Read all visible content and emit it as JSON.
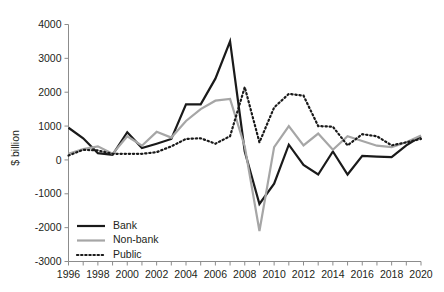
{
  "chart_data": {
    "type": "line",
    "title": "",
    "subtitle": "",
    "xlabel": "",
    "ylabel": "$ billion",
    "xlim": [
      1996,
      2020
    ],
    "ylim": [
      -3000,
      4000
    ],
    "grid": false,
    "legend_position": "bottom-left",
    "x": [
      1996,
      1997,
      1998,
      1999,
      2000,
      2001,
      2002,
      2003,
      2004,
      2005,
      2006,
      2007,
      2008,
      2009,
      2010,
      2011,
      2012,
      2013,
      2014,
      2015,
      2016,
      2017,
      2018,
      2019,
      2020
    ],
    "x_tick_labels": [
      "1996",
      "1998",
      "2000",
      "2002",
      "2004",
      "2006",
      "2008",
      "2010",
      "2012",
      "2014",
      "2016",
      "2018",
      "2020"
    ],
    "y_tick_labels": [
      "4000",
      "3000",
      "2000",
      "1000",
      "0",
      "-1000",
      "-2000",
      "-3000"
    ],
    "y_ticks": [
      4000,
      3000,
      2000,
      1000,
      0,
      -1000,
      -2000,
      -3000
    ],
    "series": [
      {
        "name": "Bank",
        "style": "solid",
        "color": "#1a1a1a",
        "width": 2.2,
        "values": [
          950,
          640,
          200,
          150,
          820,
          350,
          480,
          620,
          1640,
          1640,
          2400,
          3500,
          250,
          -1300,
          -700,
          450,
          -150,
          -430,
          250,
          -430,
          120,
          100,
          80,
          430,
          700
        ]
      },
      {
        "name": "Non-bank",
        "style": "solid",
        "color": "#a6a6a6",
        "width": 2.2,
        "values": [
          180,
          320,
          400,
          180,
          700,
          420,
          830,
          660,
          1150,
          1500,
          1750,
          1800,
          400,
          -2100,
          380,
          1000,
          430,
          780,
          300,
          700,
          560,
          420,
          380,
          520,
          720
        ]
      },
      {
        "name": "Public",
        "style": "dotted",
        "color": "#1a1a1a",
        "width": 2.2,
        "values": [
          130,
          300,
          280,
          180,
          180,
          180,
          230,
          400,
          620,
          640,
          480,
          700,
          2150,
          520,
          1550,
          1950,
          1900,
          1000,
          980,
          430,
          760,
          700,
          430,
          520,
          620
        ]
      }
    ]
  },
  "legend": {
    "items": [
      {
        "label": "Bank",
        "style": "solid",
        "color": "#1a1a1a"
      },
      {
        "label": "Non-bank",
        "style": "solid",
        "color": "#a6a6a6"
      },
      {
        "label": "Public",
        "style": "dotted",
        "color": "#1a1a1a"
      }
    ]
  },
  "axes": {
    "y_title": "$ billion"
  }
}
